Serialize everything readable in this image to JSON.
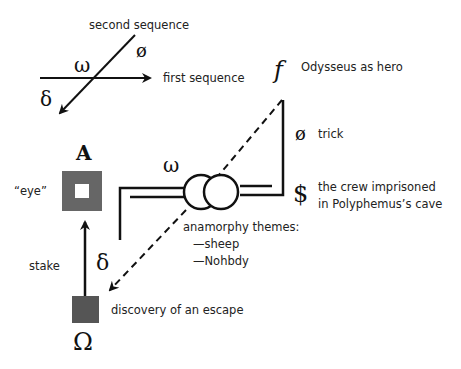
{
  "legend": {
    "second_sequence": "second sequence",
    "first_sequence": "first sequence",
    "omega_small": "ω",
    "delta": "δ",
    "null": "ø"
  },
  "right_column": {
    "f_symbol": "f",
    "f_label": "Odysseus as hero",
    "null_symbol": "ø",
    "null_label": "trick",
    "dollar_symbol": "$",
    "dollar_label_1": "the crew imprisoned",
    "dollar_label_2": "in Polyphemus’s cave"
  },
  "center": {
    "omega_small": "ω",
    "anamorphy_title": "anamorphy themes:",
    "anamorphy_items": [
      "—sheep",
      "—Nohbdy"
    ]
  },
  "left_column": {
    "A_symbol": "A",
    "eye_label": "“eye”",
    "stake_label": "stake",
    "delta": "δ",
    "escape_label": "discovery of an escape",
    "Omega_symbol": "Ω"
  },
  "colors": {
    "ink": "#111111",
    "square_fill": "#666666",
    "text": "#222222"
  }
}
